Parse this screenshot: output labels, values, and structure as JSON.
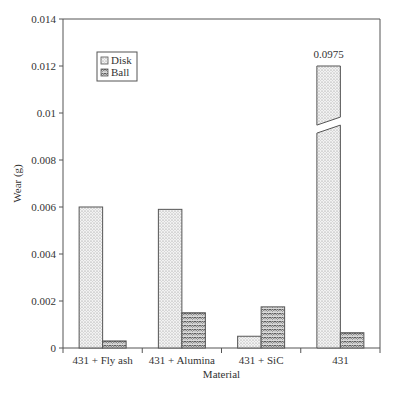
{
  "chart_data": {
    "type": "bar",
    "title": "",
    "xlabel": "Material",
    "ylabel": "Wear (g)",
    "ylim": [
      0,
      0.014
    ],
    "yticks": [
      "0",
      "0.002",
      "0.004",
      "0.006",
      "0.008",
      "0.01",
      "0.012",
      "0.014"
    ],
    "categories": [
      "431 + Fly ash",
      "431 + Alumina",
      "431 + SiC",
      "431"
    ],
    "series": [
      {
        "name": "Disk",
        "values": [
          0.006,
          0.0059,
          0.0005,
          0.0975
        ],
        "pattern": "fine-dots"
      },
      {
        "name": "Ball",
        "values": [
          0.0003,
          0.0015,
          0.00175,
          0.00065
        ],
        "pattern": "zigzag"
      }
    ],
    "annotations": [
      {
        "text": "0.0975",
        "target": "431 Disk",
        "note": "broken bar, actual value exceeds axis"
      }
    ],
    "broken_bar": {
      "category": "431",
      "series": "Disk",
      "display_top": 0.012,
      "break_at": 0.0094
    },
    "legend": {
      "position": "upper-left-inside",
      "entries": [
        "Disk",
        "Ball"
      ]
    },
    "grid": false
  }
}
